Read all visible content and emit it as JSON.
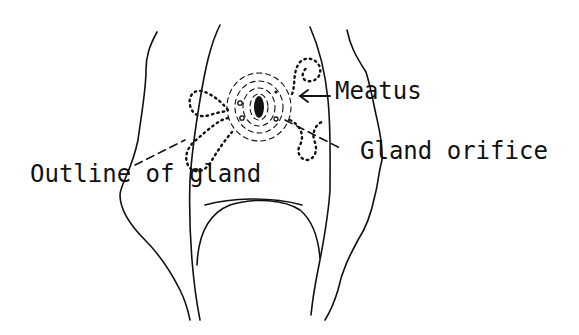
{
  "diagram": {
    "labels": {
      "meatus": "Meatus",
      "gland_orifice": "Gland orifice",
      "outline_of_gland": "Outline of gland"
    },
    "colors": {
      "ink": "#111111",
      "background": "#ffffff"
    }
  }
}
